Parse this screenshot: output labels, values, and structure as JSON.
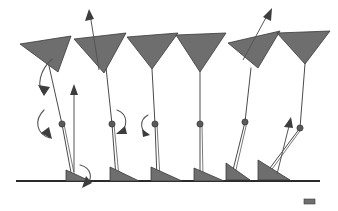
{
  "figure": {
    "background_color": "#ffffff",
    "ground_color": "#2b2b2b",
    "segment_fill_color": "#6e6e6e",
    "segment_stroke_color": "#3a3a3a",
    "joint_color": "#5a5a5a",
    "arrow_color": "#555555",
    "ground": {
      "label": "ground-line",
      "y": 181,
      "x_start": 16,
      "x_end": 320
    },
    "scale_marker": {
      "label": "scale-marker",
      "x": 304,
      "y": 199,
      "width": 11,
      "height": 5
    },
    "poses": [
      {
        "id": "pose-1",
        "label": "Pose 1 — early stance, heel contact",
        "hip": {
          "x": 47,
          "y": 55
        },
        "knee": {
          "x": 62,
          "y": 124
        },
        "ankle": {
          "x": 72,
          "y": 178
        },
        "thigh_polygon": "20,44 71,36 58,72",
        "foot_polygon": "66,170 90,181 66,181",
        "shin_line": "62,124 72,178",
        "femur_line": "47,57 62,124"
      },
      {
        "id": "pose-2",
        "label": "Pose 2 — mid stance, vertical loading",
        "hip": {
          "x": 105,
          "y": 56
        },
        "knee": {
          "x": 112,
          "y": 124
        },
        "ankle": {
          "x": 116,
          "y": 177
        },
        "thigh_polygon": "74,39 126,33 104,73",
        "foot_polygon": "110,167 139,181 110,181",
        "shin_line": "112,124 116,177",
        "femur_line": "105,58 112,124"
      },
      {
        "id": "pose-3",
        "label": "Pose 3 — mid stance, knee extended",
        "hip": {
          "x": 152,
          "y": 68
        },
        "knee": {
          "x": 155,
          "y": 124
        },
        "ankle": {
          "x": 157,
          "y": 178
        },
        "thigh_polygon": "127,37 178,33 152,69",
        "foot_polygon": "151,167 182,181 151,181",
        "shin_line": "155,124 157,178",
        "femur_line": "152,69 155,124"
      },
      {
        "id": "pose-4",
        "label": "Pose 4 — terminal stance, heel rise",
        "hip": {
          "x": 200,
          "y": 70
        },
        "knee": {
          "x": 200,
          "y": 124
        },
        "ankle": {
          "x": 200,
          "y": 178
        },
        "thigh_polygon": "176,35 226,33 200,72",
        "foot_polygon": "194,168 224,181 194,181",
        "shin_line": "200,124 200,178",
        "femur_line": "200,72 200,124"
      },
      {
        "id": "pose-5",
        "label": "Pose 5 — pre-swing, toe off",
        "hip": {
          "x": 251,
          "y": 66
        },
        "knee": {
          "x": 245,
          "y": 122
        },
        "ankle": {
          "x": 232,
          "y": 174
        },
        "thigh_polygon": "228,43 280,31 258,68",
        "foot_polygon": "226,163 250,180 226,180",
        "shin_line": "245,122 232,174",
        "femur_line": "251,68 245,122"
      },
      {
        "id": "pose-6",
        "label": "Pose 6 — initial swing, trailing limb",
        "hip": {
          "x": 305,
          "y": 60
        },
        "knee": {
          "x": 300,
          "y": 128
        },
        "ankle": {
          "x": 264,
          "y": 176
        },
        "thigh_polygon": "277,33 330,31 305,64",
        "foot_polygon": "258,160 290,180 258,180",
        "shin_line": "300,128 264,176",
        "femur_line": "305,64 300,128"
      }
    ],
    "rotation_arrows": [
      {
        "id": "rot-1",
        "label": "hip-rotation-arrow-pose-1",
        "path": "M 52 59 C 40 70 36 86 44 94",
        "head": "44,96 38,85 50,87"
      },
      {
        "id": "rot-2",
        "label": "knee-rotation-arrow-pose-1",
        "path": "M 44 110 C 34 120 36 134 50 138",
        "head": "52,139 41,133 49,127"
      },
      {
        "id": "rot-3",
        "label": "ankle-rotation-arrow-pose-1",
        "path": "M 80 165 C 92 168 94 180 84 186",
        "head": "82,188 86,176 92,183"
      },
      {
        "id": "rot-4",
        "label": "knee-rotation-arrow-pose-2",
        "path": "M 117 110 C 128 114 129 128 118 133",
        "head": "116,134 125,126 127,134"
      },
      {
        "id": "rot-5",
        "label": "knee-rotation-arrow-pose-3",
        "path": "M 148 115 C 139 120 140 131 148 134",
        "head": "150,135 142,129 143,137"
      }
    ],
    "vector_arrows": [
      {
        "id": "vec-1",
        "label": "ground-reaction-vector-pose-2",
        "x1": 74,
        "y1": 172,
        "x2": 74,
        "y2": 90,
        "head": "74,84 70,95 78,95"
      },
      {
        "id": "vec-2",
        "label": "hip-velocity-vector-pose-2",
        "x1": 99,
        "y1": 70,
        "x2": 90,
        "y2": 14,
        "head": "89,9 85,21 94,19"
      },
      {
        "id": "vec-3",
        "label": "hip-velocity-vector-pose-5",
        "x1": 243,
        "y1": 60,
        "x2": 269,
        "y2": 12,
        "head": "272,8 263,17 271,21"
      },
      {
        "id": "vec-4",
        "label": "shank-velocity-vector-pose-6",
        "x1": 277,
        "y1": 174,
        "x2": 290,
        "y2": 122,
        "head": "291,117 284,127 293,128"
      }
    ]
  }
}
